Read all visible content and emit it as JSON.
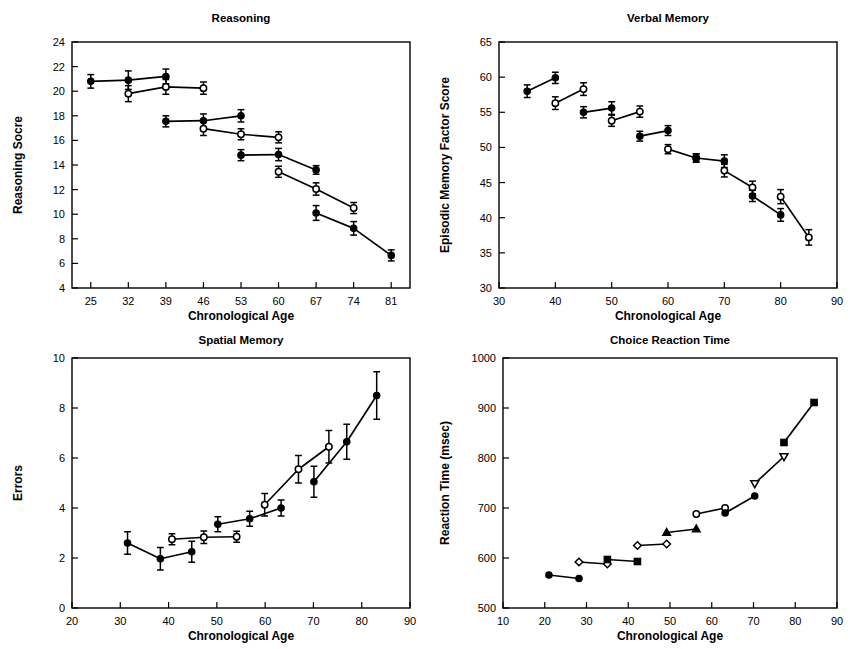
{
  "figure": {
    "caption_fragment": "",
    "panel_count": 4
  },
  "axis_titles": {
    "x_common": "Chronological Age"
  },
  "chart_data": [
    {
      "id": "reasoning",
      "type": "line",
      "title": "Reasoning",
      "xlabel": "Chronological Age",
      "ylabel": "Reasoning Socre",
      "xlim": [
        21.5,
        84.5
      ],
      "ylim": [
        4,
        24
      ],
      "xticks": [
        25,
        32,
        39,
        46,
        53,
        60,
        67,
        74,
        81
      ],
      "yticks": [
        4,
        6,
        8,
        10,
        12,
        14,
        16,
        18,
        20,
        22,
        24
      ],
      "grid": false,
      "legend": "none",
      "error_bars": true,
      "series": [
        {
          "name": "Cohort 1 upper",
          "marker": "filled-circle",
          "x": [
            25,
            32,
            39
          ],
          "y": [
            20.8,
            20.9,
            21.2
          ],
          "err": [
            0.55,
            0.75,
            0.6
          ]
        },
        {
          "name": "Cohort 1 lower",
          "marker": "open-circle",
          "x": [
            32,
            39,
            46
          ],
          "y": [
            19.8,
            20.35,
            20.25
          ],
          "err": [
            0.65,
            0.6,
            0.5
          ]
        },
        {
          "name": "Cohort 2 upper",
          "marker": "filled-circle",
          "x": [
            39,
            46,
            53
          ],
          "y": [
            17.55,
            17.6,
            18.0
          ],
          "err": [
            0.45,
            0.55,
            0.5
          ]
        },
        {
          "name": "Cohort 2 lower",
          "marker": "open-circle",
          "x": [
            46,
            53,
            60
          ],
          "y": [
            16.95,
            16.5,
            16.25
          ],
          "err": [
            0.55,
            0.45,
            0.45
          ]
        },
        {
          "name": "Cohort 3 upper",
          "marker": "filled-circle",
          "x": [
            53,
            60,
            67
          ],
          "y": [
            14.8,
            14.85,
            13.6
          ],
          "err": [
            0.45,
            0.5,
            0.35
          ]
        },
        {
          "name": "Cohort 3 lower",
          "marker": "open-circle",
          "x": [
            60,
            67,
            74
          ],
          "y": [
            13.45,
            12.05,
            10.5
          ],
          "err": [
            0.45,
            0.5,
            0.45
          ]
        },
        {
          "name": "Cohort 4",
          "marker": "filled-circle",
          "x": [
            67,
            74,
            81
          ],
          "y": [
            10.1,
            8.85,
            6.65
          ],
          "err": [
            0.6,
            0.55,
            0.45
          ]
        }
      ]
    },
    {
      "id": "verbal-memory",
      "type": "line",
      "title": "Verbal Memory",
      "xlabel": "Chronological Age",
      "ylabel": "Episodic Memory Factor Score",
      "xlim": [
        30,
        90
      ],
      "ylim": [
        30,
        65
      ],
      "xticks": [
        30,
        40,
        50,
        60,
        70,
        80,
        90
      ],
      "yticks": [
        30,
        35,
        40,
        45,
        50,
        55,
        60,
        65
      ],
      "grid": false,
      "legend": "none",
      "error_bars": true,
      "series": [
        {
          "name": "Cohort 1",
          "marker": "filled-circle",
          "x": [
            35,
            40
          ],
          "y": [
            58.0,
            59.9
          ],
          "err": [
            0.9,
            0.8
          ]
        },
        {
          "name": "Cohort 2",
          "marker": "open-circle",
          "x": [
            40,
            45
          ],
          "y": [
            56.3,
            58.3
          ],
          "err": [
            0.9,
            0.9
          ]
        },
        {
          "name": "Cohort 3",
          "marker": "filled-circle",
          "x": [
            45,
            50
          ],
          "y": [
            55.0,
            55.6
          ],
          "err": [
            0.8,
            0.9
          ]
        },
        {
          "name": "Cohort 4",
          "marker": "open-circle",
          "x": [
            50,
            55
          ],
          "y": [
            53.8,
            55.1
          ],
          "err": [
            0.8,
            0.8
          ]
        },
        {
          "name": "Cohort 5",
          "marker": "filled-circle",
          "x": [
            55,
            60
          ],
          "y": [
            51.6,
            52.4
          ],
          "err": [
            0.7,
            0.7
          ]
        },
        {
          "name": "Cohort 6",
          "marker": "open-circle",
          "x": [
            60,
            65
          ],
          "y": [
            49.75,
            48.5
          ],
          "err": [
            0.65,
            0.6
          ]
        },
        {
          "name": "Cohort 7",
          "marker": "filled-circle",
          "x": [
            65,
            70
          ],
          "y": [
            48.5,
            48.05
          ],
          "err": [
            0.6,
            0.9
          ]
        },
        {
          "name": "Cohort 8",
          "marker": "open-circle",
          "x": [
            70,
            75
          ],
          "y": [
            46.7,
            44.3
          ],
          "err": [
            0.9,
            0.9
          ]
        },
        {
          "name": "Cohort 9",
          "marker": "filled-circle",
          "x": [
            75,
            80
          ],
          "y": [
            43.1,
            40.4
          ],
          "err": [
            0.8,
            0.9
          ]
        },
        {
          "name": "Cohort 10",
          "marker": "open-circle",
          "x": [
            80,
            85
          ],
          "y": [
            43.0,
            37.2
          ],
          "err": [
            1.0,
            1.1
          ]
        }
      ]
    },
    {
      "id": "spatial-memory",
      "type": "line",
      "title": "Spatial Memory",
      "xlabel": "Chronological Age",
      "ylabel": "Errors",
      "xlim": [
        20,
        90
      ],
      "ylim": [
        0,
        10
      ],
      "xticks": [
        20,
        30,
        40,
        50,
        60,
        70,
        80,
        90
      ],
      "yticks": [
        0,
        2,
        4,
        6,
        8,
        10
      ],
      "grid": false,
      "legend": "none",
      "error_bars": true,
      "series": [
        {
          "name": "Cohort 1",
          "marker": "filled-circle",
          "x": [
            31.5,
            38.3,
            44.8
          ],
          "y": [
            2.6,
            1.97,
            2.25
          ],
          "err": [
            0.45,
            0.45,
            0.42
          ]
        },
        {
          "name": "Cohort 2",
          "marker": "open-circle",
          "x": [
            40.7,
            47.3,
            54.1
          ],
          "y": [
            2.75,
            2.83,
            2.85
          ],
          "err": [
            0.22,
            0.25,
            0.22
          ]
        },
        {
          "name": "Cohort 3",
          "marker": "filled-circle",
          "x": [
            50.2,
            56.8,
            63.3
          ],
          "y": [
            3.35,
            3.57,
            4.0
          ],
          "err": [
            0.3,
            0.3,
            0.32
          ]
        },
        {
          "name": "Cohort 4",
          "marker": "open-circle",
          "x": [
            59.9,
            66.9,
            73.2
          ],
          "y": [
            4.13,
            5.55,
            6.45
          ],
          "err": [
            0.45,
            0.55,
            0.65
          ]
        },
        {
          "name": "Cohort 5",
          "marker": "filled-circle",
          "x": [
            70.1,
            76.9,
            83.1
          ],
          "y": [
            5.05,
            6.65,
            8.5
          ],
          "err": [
            0.62,
            0.7,
            0.95
          ]
        }
      ]
    },
    {
      "id": "choice-reaction-time",
      "type": "line",
      "title": "Choice Reaction Time",
      "xlabel": "Chronological Age",
      "ylabel": "Reaction Time (msec)",
      "xlim": [
        10,
        90
      ],
      "ylim": [
        500,
        1000
      ],
      "xticks": [
        10,
        20,
        30,
        40,
        50,
        60,
        70,
        80,
        90
      ],
      "yticks": [
        500,
        600,
        700,
        800,
        900,
        1000
      ],
      "grid": false,
      "legend": "none",
      "error_bars": false,
      "series": [
        {
          "name": "Cohort 1",
          "marker": "filled-circle",
          "x": [
            21.0,
            28.2
          ],
          "y": [
            566,
            559
          ]
        },
        {
          "name": "Cohort 2",
          "marker": "open-diamond",
          "x": [
            28.2,
            35.0
          ],
          "y": [
            592,
            588
          ]
        },
        {
          "name": "Cohort 3",
          "marker": "filled-square",
          "x": [
            35.0,
            42.2
          ],
          "y": [
            597,
            593
          ]
        },
        {
          "name": "Cohort 4",
          "marker": "open-diamond",
          "x": [
            42.2,
            49.2
          ],
          "y": [
            625,
            628
          ]
        },
        {
          "name": "Cohort 5",
          "marker": "filled-triangle",
          "x": [
            49.2,
            56.3
          ],
          "y": [
            651,
            658
          ]
        },
        {
          "name": "Cohort 6",
          "marker": "open-circle",
          "x": [
            56.3,
            63.2
          ],
          "y": [
            688,
            700
          ]
        },
        {
          "name": "Cohort 7",
          "marker": "filled-circle",
          "x": [
            63.2,
            70.3
          ],
          "y": [
            690,
            724
          ]
        },
        {
          "name": "Cohort 8",
          "marker": "open-down-triangle",
          "x": [
            70.3,
            77.3
          ],
          "y": [
            749,
            803
          ]
        },
        {
          "name": "Cohort 9",
          "marker": "filled-square",
          "x": [
            77.3,
            84.5
          ],
          "y": [
            831,
            911
          ]
        }
      ]
    }
  ]
}
